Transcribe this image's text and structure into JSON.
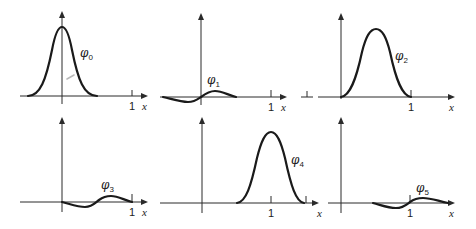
{
  "figure": {
    "panels": [
      {
        "id": "phi0",
        "symbol": "φ",
        "subscript": "0",
        "tick_label": "1",
        "axis_label": "x"
      },
      {
        "id": "phi1",
        "symbol": "φ",
        "subscript": "1",
        "tick_label": "1",
        "axis_label": "x"
      },
      {
        "id": "phi2",
        "symbol": "φ",
        "subscript": "2",
        "tick_label": "1",
        "axis_label": "x"
      },
      {
        "id": "phi3",
        "symbol": "φ",
        "subscript": "3",
        "tick_label": "1",
        "axis_label": "x"
      },
      {
        "id": "phi4",
        "symbol": "φ",
        "subscript": "4",
        "tick_label": "1",
        "axis_label": "x"
      },
      {
        "id": "phi5",
        "symbol": "φ",
        "subscript": "5",
        "tick_label": "1",
        "axis_label": "x"
      }
    ],
    "colors": {
      "curve": "#1a1a1a",
      "axis": "#2a2a2a",
      "background": "#ffffff"
    }
  }
}
